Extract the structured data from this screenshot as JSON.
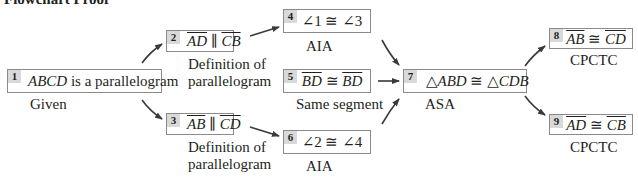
{
  "title": "Flowchart Proof",
  "colors": {
    "border": "#8a8a8a",
    "number_bg": "#d9d9d9",
    "arrow": "#3a3a3a",
    "text": "#231f20"
  },
  "steps": [
    {
      "num": "1",
      "statement": "ABCD is a parallelogram",
      "reason": "Given"
    },
    {
      "num": "2",
      "statement": "AD ∥ CB",
      "seg1": "AD",
      "rel": "∥",
      "seg2": "CB",
      "reason_line1": "Definition of",
      "reason_line2": "parallelogram"
    },
    {
      "num": "3",
      "statement": "AB ∥ CD",
      "seg1": "AB",
      "rel": "∥",
      "seg2": "CD",
      "reason_line1": "Definition of",
      "reason_line2": "parallelogram"
    },
    {
      "num": "4",
      "statement": "∠1 ≅ ∠3",
      "reason": "AIA"
    },
    {
      "num": "5",
      "statement": "BD ≅ BD",
      "seg1": "BD",
      "rel": "≅",
      "seg2": "BD",
      "reason": "Same segment"
    },
    {
      "num": "6",
      "statement": "∠2 ≅ ∠4",
      "reason": "AIA"
    },
    {
      "num": "7",
      "statement": "△ABD ≅ △CDB",
      "tri1": "ABD",
      "rel": "≅",
      "tri2": "CDB",
      "tri_symbol": "△",
      "reason": "ASA"
    },
    {
      "num": "8",
      "statement": "AB ≅ CD",
      "seg1": "AB",
      "rel": "≅",
      "seg2": "CD",
      "reason": "CPCTC"
    },
    {
      "num": "9",
      "statement": "AD ≅ CB",
      "seg1": "AD",
      "rel": "≅",
      "seg2": "CB",
      "reason": "CPCTC"
    }
  ],
  "connections": [
    {
      "from": "1",
      "to": "2"
    },
    {
      "from": "1",
      "to": "3"
    },
    {
      "from": "2",
      "to": "4"
    },
    {
      "from": "3",
      "to": "6"
    },
    {
      "from": "4",
      "to": "7"
    },
    {
      "from": "5",
      "to": "7"
    },
    {
      "from": "6",
      "to": "7"
    },
    {
      "from": "7",
      "to": "8"
    },
    {
      "from": "7",
      "to": "9"
    }
  ]
}
